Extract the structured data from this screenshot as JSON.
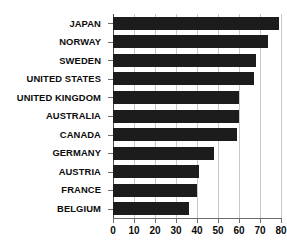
{
  "chart_data": {
    "type": "bar",
    "orientation": "horizontal",
    "title": "",
    "subtitle": "",
    "xlabel": "",
    "ylabel": "",
    "categories": [
      "JAPAN",
      "NORWAY",
      "SWEDEN",
      "UNITED STATES",
      "UNITED KINGDOM",
      "AUSTRALIA",
      "CANADA",
      "GERMANY",
      "AUSTRIA",
      "FRANCE",
      "BELGIUM"
    ],
    "values": [
      79,
      74,
      68,
      67,
      60,
      60,
      59,
      48,
      41,
      40,
      36
    ],
    "xlim": [
      0,
      80
    ],
    "xticks": [
      0,
      10,
      20,
      30,
      40,
      50,
      60,
      70,
      80
    ],
    "xtick_labels": [
      "0",
      "10",
      "20",
      "30",
      "40",
      "50",
      "60",
      "70",
      "80"
    ],
    "grid": "vertical",
    "legend": "none",
    "bar_color": "#1c1c1c",
    "grid_color": "#c9c9c9",
    "axis_color": "#6d6d6d",
    "background_color": "#ffffff",
    "label_color": "#0b0b0b"
  }
}
